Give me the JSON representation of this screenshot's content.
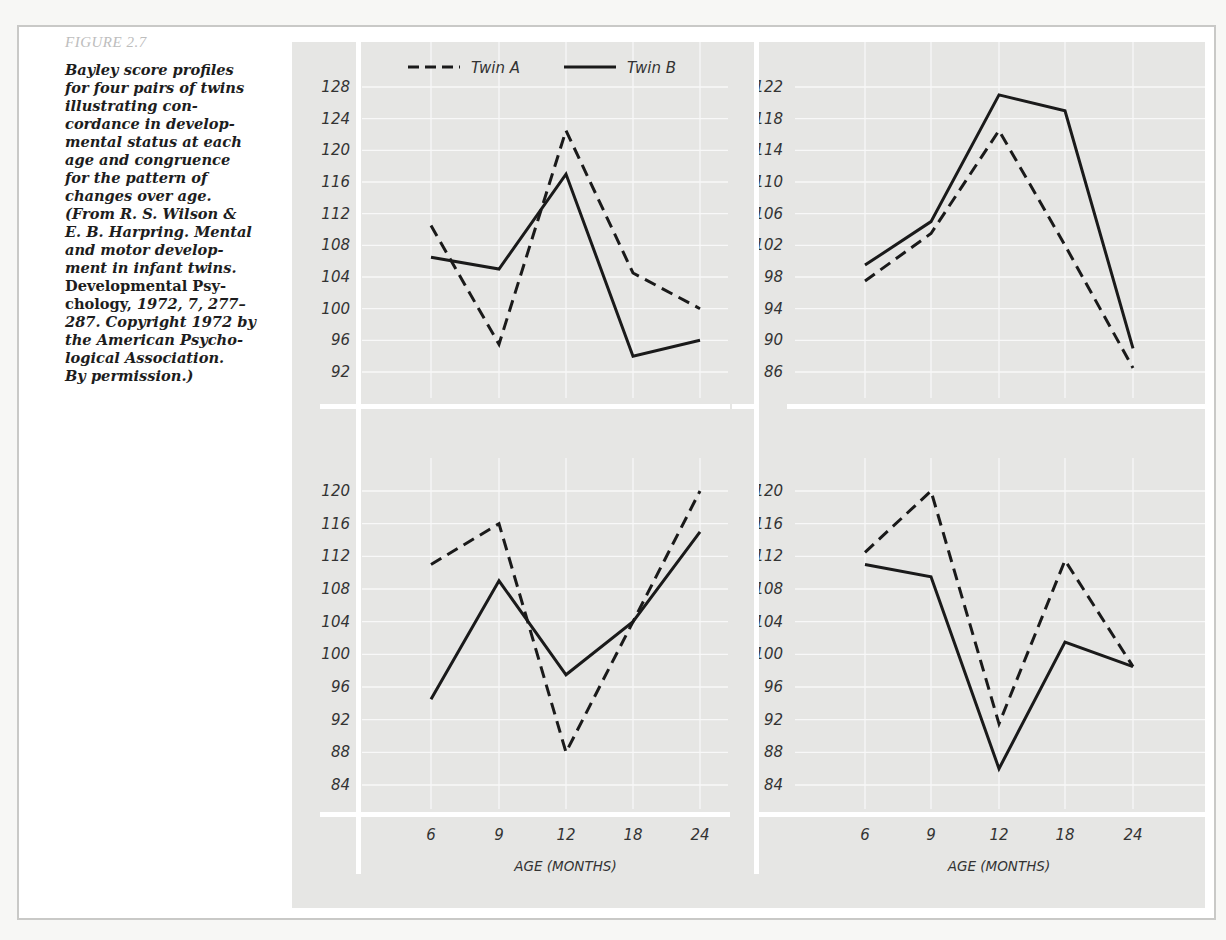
{
  "figure": {
    "label": "FIGURE 2.7",
    "caption_lines": [
      {
        "text": "Bayley score profiles",
        "upright": false
      },
      {
        "text": "for four pairs of twins",
        "upright": false
      },
      {
        "text": "illustrating con-",
        "upright": false
      },
      {
        "text": "cordance in develop-",
        "upright": false
      },
      {
        "text": "mental status at each",
        "upright": false
      },
      {
        "text": "age and congruence",
        "upright": false
      },
      {
        "text": "for the pattern of",
        "upright": false
      },
      {
        "text": "changes over age.",
        "upright": false
      },
      {
        "text": "(From R. S. Wilson &",
        "upright": false
      },
      {
        "text": "E. B. Harpring. Mental",
        "upright": false
      },
      {
        "text": "and motor develop-",
        "upright": false
      },
      {
        "text": "ment in infant twins.",
        "upright": false
      },
      {
        "text": "Developmental Psy-",
        "upright": true
      },
      {
        "text": "chology, 1972, 7, 277–",
        "upright": "mixed"
      },
      {
        "text": "287. Copyright 1972 by",
        "upright": false
      },
      {
        "text": "the American Psycho-",
        "upright": false
      },
      {
        "text": "logical Association.",
        "upright": false
      },
      {
        "text": "By permission.)",
        "upright": false
      }
    ]
  },
  "legend": {
    "twin_a": "Twin A",
    "twin_b": "Twin B"
  },
  "colors": {
    "background": "#e6e6e4",
    "grid": "#f8f8f8",
    "axis_white": "#ffffff",
    "line": "#1a1a1a",
    "caption_label": "#bdbdbd"
  },
  "chart_data": [
    {
      "type": "line",
      "panel": "top-left",
      "title": "",
      "xlabel": "",
      "ylabel": "",
      "categories": [
        "6",
        "9",
        "12",
        "18",
        "24"
      ],
      "yticks": [
        92,
        96,
        100,
        104,
        108,
        112,
        116,
        120,
        124,
        128
      ],
      "ylim": [
        90,
        130
      ],
      "grid": true,
      "legend_position": "top",
      "series": [
        {
          "name": "Twin A",
          "style": "dashed",
          "values": [
            110.5,
            95.5,
            122.5,
            104.5,
            100
          ]
        },
        {
          "name": "Twin B",
          "style": "solid",
          "values": [
            106.5,
            105,
            117,
            94,
            96
          ]
        }
      ]
    },
    {
      "type": "line",
      "panel": "top-right",
      "title": "",
      "xlabel": "",
      "ylabel": "",
      "categories": [
        "6",
        "9",
        "12",
        "18",
        "24"
      ],
      "yticks": [
        86,
        90,
        94,
        98,
        102,
        106,
        110,
        114,
        118,
        122
      ],
      "ylim": [
        84,
        124
      ],
      "grid": true,
      "series": [
        {
          "name": "Twin A",
          "style": "dashed",
          "values": [
            97.5,
            103.5,
            116.5,
            102,
            86.5
          ]
        },
        {
          "name": "Twin B",
          "style": "solid",
          "values": [
            99.5,
            105,
            121,
            119,
            89
          ]
        }
      ]
    },
    {
      "type": "line",
      "panel": "bottom-left",
      "title": "",
      "xlabel": "AGE (MONTHS)",
      "ylabel": "",
      "categories": [
        "6",
        "9",
        "12",
        "18",
        "24"
      ],
      "yticks": [
        84,
        88,
        92,
        96,
        100,
        104,
        108,
        112,
        116,
        120
      ],
      "ylim": [
        82,
        122
      ],
      "grid": true,
      "series": [
        {
          "name": "Twin A",
          "style": "dashed",
          "values": [
            111,
            116,
            88,
            104,
            120
          ]
        },
        {
          "name": "Twin B",
          "style": "solid",
          "values": [
            94.5,
            109,
            97.5,
            104,
            115
          ]
        }
      ]
    },
    {
      "type": "line",
      "panel": "bottom-right",
      "title": "",
      "xlabel": "AGE (MONTHS)",
      "ylabel": "",
      "categories": [
        "6",
        "9",
        "12",
        "18",
        "24"
      ],
      "yticks": [
        84,
        88,
        92,
        96,
        100,
        104,
        108,
        112,
        116,
        120
      ],
      "ylim": [
        82,
        122
      ],
      "grid": true,
      "series": [
        {
          "name": "Twin A",
          "style": "dashed",
          "values": [
            112.5,
            120,
            91.5,
            111.5,
            98.5
          ]
        },
        {
          "name": "Twin B",
          "style": "solid",
          "values": [
            111,
            109.5,
            86,
            101.5,
            98.5
          ]
        }
      ]
    }
  ]
}
